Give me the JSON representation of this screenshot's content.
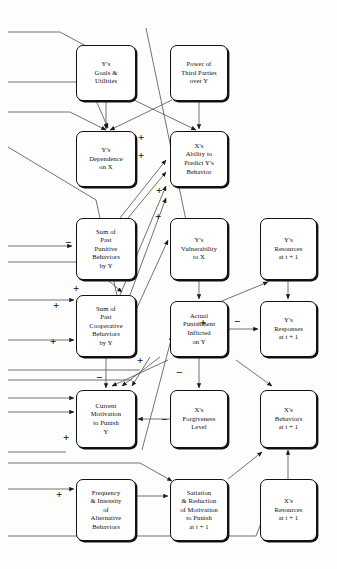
{
  "diagram": {
    "type": "flowchart",
    "background": "#fdfdfc",
    "line_color": "#444444",
    "box_border_color": "#111111",
    "nodes": [
      {
        "id": "y_goals",
        "label": "Y's\nGoals &\nUtilities",
        "x": 76,
        "y": 45,
        "w": 60,
        "h": 56
      },
      {
        "id": "third_parties",
        "label": "Power of\nThird Parties\nover Y",
        "x": 170,
        "y": 45,
        "w": 58,
        "h": 56
      },
      {
        "id": "y_dependence",
        "label": "Y's\nDependence\non X",
        "x": 76,
        "y": 131,
        "w": 60,
        "h": 56
      },
      {
        "id": "x_predict",
        "label": "X's\nAbility to\nPredict Y's\nBehavior",
        "x": 170,
        "y": 131,
        "w": 58,
        "h": 56
      },
      {
        "id": "past_punitive",
        "label": "Sum of\nPast\nPunitive\nBehaviors\nby Y",
        "x": 76,
        "y": 218,
        "w": 60,
        "h": 62
      },
      {
        "id": "y_vulnerable",
        "label": "Y's\nVulnerability\nto X",
        "x": 170,
        "y": 218,
        "w": 58,
        "h": 62
      },
      {
        "id": "y_resources",
        "label": "Y's\nResources\nat t + 1",
        "x": 260,
        "y": 218,
        "w": 57,
        "h": 62
      },
      {
        "id": "past_coop",
        "label": "Sum of\nPast\nCooperative\nBehaviors\nby Y",
        "x": 76,
        "y": 295,
        "w": 60,
        "h": 62
      },
      {
        "id": "actual_punish",
        "label": "Actual\nPunishment\nInflicted\non Y",
        "x": 170,
        "y": 301,
        "w": 58,
        "h": 56
      },
      {
        "id": "y_responses",
        "label": "Y's\nResponses\nat t + 1",
        "x": 260,
        "y": 301,
        "w": 57,
        "h": 56
      },
      {
        "id": "current_motiv",
        "label": "Current\nMotivation\nto Punish\nY",
        "x": 76,
        "y": 390,
        "w": 60,
        "h": 58
      },
      {
        "id": "forgiveness",
        "label": "X's\nForgiveness\nLevel",
        "x": 170,
        "y": 390,
        "w": 58,
        "h": 58
      },
      {
        "id": "x_behaviors",
        "label": "X's\nBehaviors\nat t + 1",
        "x": 260,
        "y": 390,
        "w": 57,
        "h": 58
      },
      {
        "id": "freq_intensity",
        "label": "Frequency\n& Intensity\nof\nAlternative\nBehaviors",
        "x": 76,
        "y": 479,
        "w": 60,
        "h": 62
      },
      {
        "id": "satiation",
        "label": "Satiation\n& Reduction\nof Motivation\nto Punish\nat t + 1",
        "x": 170,
        "y": 479,
        "w": 58,
        "h": 62
      },
      {
        "id": "x_resources",
        "label": "X's\nResources\nat t + 1",
        "x": 260,
        "y": 479,
        "w": 57,
        "h": 62
      }
    ],
    "signs": [
      {
        "symbol": "+",
        "x": 138,
        "y": 132
      },
      {
        "symbol": "+",
        "x": 138,
        "y": 150
      },
      {
        "symbol": "+",
        "x": 156,
        "y": 185
      },
      {
        "symbol": "+",
        "x": 155,
        "y": 211
      },
      {
        "symbol": "−",
        "x": 65,
        "y": 237
      },
      {
        "symbol": "+",
        "x": 73,
        "y": 283
      },
      {
        "symbol": "+",
        "x": 53,
        "y": 300
      },
      {
        "symbol": "+",
        "x": 50,
        "y": 336
      },
      {
        "symbol": "+",
        "x": 137,
        "y": 355
      },
      {
        "symbol": "−",
        "x": 96,
        "y": 372
      },
      {
        "symbol": "−",
        "x": 176,
        "y": 367
      },
      {
        "symbol": "−",
        "x": 161,
        "y": 414
      },
      {
        "symbol": "+",
        "x": 200,
        "y": 317
      },
      {
        "symbol": "−",
        "x": 234,
        "y": 316
      },
      {
        "symbol": "+",
        "x": 63,
        "y": 432
      },
      {
        "symbol": "+",
        "x": 56,
        "y": 489
      }
    ],
    "edges": [
      "y_goals -> y_dependence",
      "y_goals -> x_predict",
      "third_parties -> x_predict",
      "third_parties -> y_dependence",
      "past_punitive -> x_predict (+)",
      "past_coop -> x_predict (+)",
      "past_punitive -> y_vulnerability",
      "y_vulnerable -> actual_punish (+)",
      "actual_punish -> y_responses",
      "actual_punish -> y_resources (-)",
      "y_resources -> y_responses",
      "current_motiv -> actual_punish",
      "forgiveness -> current_motiv (-)",
      "satiation -> x_behaviors",
      "x_resources -> x_behaviors",
      "freq_intensity -> satiation",
      "past_punitive -> current_motiv (-)",
      "past_coop -> current_motiv (-)"
    ]
  }
}
